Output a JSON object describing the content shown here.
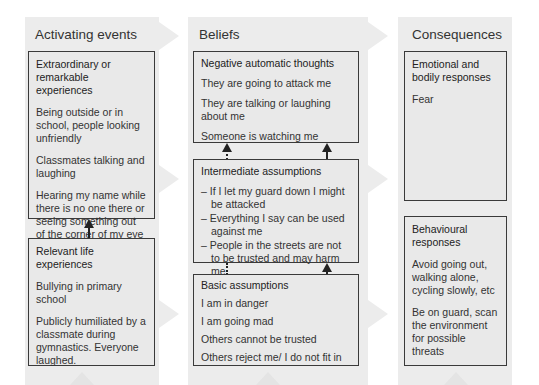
{
  "columns": [
    {
      "title": "Activating events",
      "boxes": [
        {
          "title": "Extraordinary or remarkable experiences",
          "items": [
            "Being outside or in school, people looking unfriendly",
            "Classmates talking and laughing",
            "Hearing my name while there is no one there or seeing something out of the corner of my eye"
          ]
        },
        {
          "title": "Relevant life experiences",
          "items": [
            "Bullying in primary school",
            "Publicly humiliated by a classmate during gymnastics. Everyone laughed."
          ]
        }
      ]
    },
    {
      "title": "Beliefs",
      "boxes": [
        {
          "title": "Negative automatic thoughts",
          "items": [
            "They are going to attack me",
            "They are talking or laughing about me",
            "Someone is watching me"
          ]
        },
        {
          "title": "Intermediate assumptions",
          "items": [
            "– If I let my guard down I might be attacked",
            "– Everything I say can be used against me",
            "– People in the streets are not to be trusted and may harm me"
          ]
        },
        {
          "title": "Basic assumptions",
          "items": [
            "I am in danger",
            "I am going mad",
            "Others cannot be trusted",
            "Others reject me/ I do not fit in"
          ]
        }
      ]
    },
    {
      "title": "Consequences",
      "boxes": [
        {
          "title": "Emotional and bodily responses",
          "items": [
            "Fear"
          ]
        },
        {
          "title": "Behavioural responses",
          "items": [
            "Avoid going out, walking alone, cycling slowly, etc",
            "Be on guard, scan the environment for possible threats"
          ]
        }
      ]
    }
  ],
  "colors": {
    "panel": "#ececec",
    "box_fill": "#e9e9e9",
    "border": "#3a3a3a",
    "arrow": "#222222",
    "bg_arrow": "#f0f0f0"
  }
}
